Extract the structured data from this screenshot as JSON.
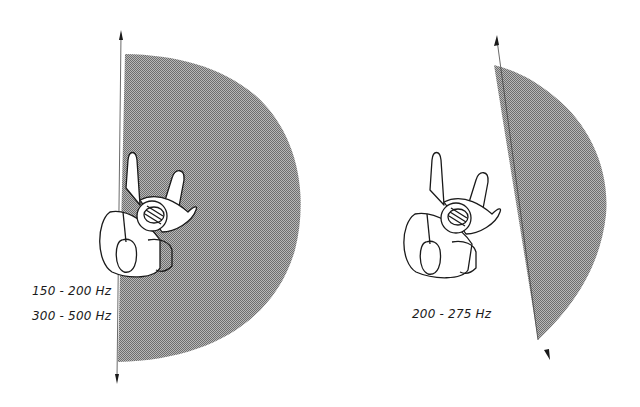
{
  "figures": [
    {
      "id": "left",
      "description": "French horn player with directional radiation pattern (half-disc, shaded)",
      "labels": [
        "150 - 200 Hz",
        "300 - 500 Hz"
      ]
    },
    {
      "id": "right",
      "description": "French horn player with directional radiation pattern (narrower wedge, shaded)",
      "labels": [
        "200 - 275 Hz"
      ]
    }
  ],
  "colors": {
    "shade": "#8a8a8a",
    "shade_light": "#b4b4b4",
    "line": "#1a1a1a",
    "background": "#ffffff"
  }
}
